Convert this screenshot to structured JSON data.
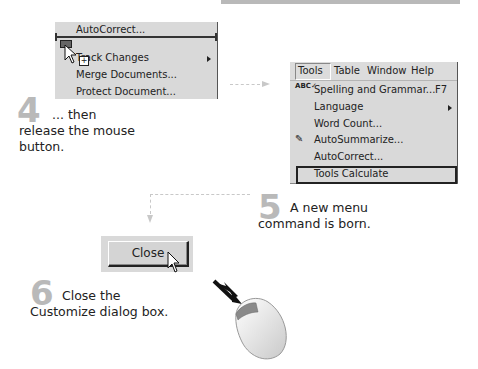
{
  "left_menu": {
    "items": [
      {
        "label": "AutoCorrect...",
        "underline": "A"
      },
      {
        "label": "Track Changes",
        "underline": "T",
        "has_submenu": true
      },
      {
        "label": "Merge Documents...",
        "underline": "D"
      },
      {
        "label": "Protect Document...",
        "underline": "P"
      }
    ]
  },
  "right_menu": {
    "menubar": [
      {
        "label": "Tools",
        "underline": "T",
        "active": true
      },
      {
        "label": "Table",
        "underline": "a"
      },
      {
        "label": "Window",
        "underline": "W"
      },
      {
        "label": "Help",
        "underline": "H"
      }
    ],
    "items": [
      {
        "label": "Spelling and Grammar...",
        "shortcut": "F7",
        "icon": "spelling-abc-icon"
      },
      {
        "label": "Language",
        "has_submenu": true
      },
      {
        "label": "Word Count..."
      },
      {
        "label": "AutoSummarize...",
        "icon": "autosummarize-icon"
      },
      {
        "label": "AutoCorrect..."
      },
      {
        "label": "Tools Calculate",
        "highlighted": true
      }
    ]
  },
  "steps": [
    {
      "number": "4",
      "line1": "... then",
      "line2": "release the mouse",
      "line3": "button."
    },
    {
      "number": "5",
      "line1": "A new menu",
      "line2": "command is born."
    },
    {
      "number": "6",
      "line1": "Close the",
      "line2": "Customize dialog box."
    }
  ],
  "close_button": {
    "label": "Close"
  },
  "colors": {
    "menu_bg": "#d9d9d9",
    "step_number": "#b9b9b9",
    "connector": "#c8c8c8"
  }
}
